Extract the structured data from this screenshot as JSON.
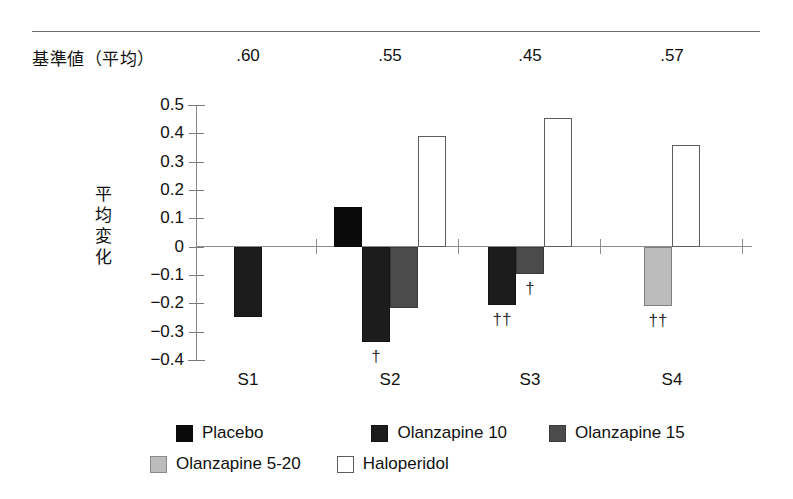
{
  "figure": {
    "baseline_row_label": "基準値（平均）",
    "y_axis_title_lines": [
      "平",
      "均",
      "変",
      "化"
    ]
  },
  "chart_data": {
    "type": "bar",
    "title": "",
    "xlabel": "",
    "ylabel": "平均変化",
    "ylim": [
      -0.4,
      0.5
    ],
    "ytick_labels": [
      "0.5",
      "0.4",
      "0.3",
      "0.2",
      "0.1",
      "0",
      "−0.1",
      "−0.2",
      "−0.3",
      "−0.4"
    ],
    "ytick_values": [
      0.5,
      0.4,
      0.3,
      0.2,
      0.1,
      0.0,
      -0.1,
      -0.2,
      -0.3,
      -0.4
    ],
    "grid": false,
    "legend_position": "bottom",
    "categories": [
      "S1",
      "S2",
      "S3",
      "S4"
    ],
    "baseline_means": [
      ".60",
      ".55",
      ".45",
      ".57"
    ],
    "series": [
      {
        "name": "Placebo",
        "color": "#0a0a0a",
        "values": [
          null,
          0.14,
          null,
          null
        ]
      },
      {
        "name": "Olanzapine 10",
        "color": "#1c1c1c",
        "values": [
          -0.25,
          -0.335,
          -0.205,
          null
        ]
      },
      {
        "name": "Olanzapine 15",
        "color": "#4b4b4b",
        "values": [
          null,
          -0.215,
          -0.095,
          null
        ]
      },
      {
        "name": "Olanzapine 5-20",
        "color": "#bcbcbc",
        "values": [
          null,
          null,
          null,
          -0.21
        ]
      },
      {
        "name": "Haloperidol",
        "color": "#ffffff",
        "values": [
          null,
          0.39,
          0.455,
          0.36
        ]
      }
    ],
    "annotations": [
      {
        "category": "S2",
        "series": "Olanzapine 10",
        "text": "†"
      },
      {
        "category": "S3",
        "series": "Olanzapine 10",
        "text": "††"
      },
      {
        "category": "S3",
        "series": "Olanzapine 15",
        "text": "†"
      },
      {
        "category": "S4",
        "series": "Olanzapine 5-20",
        "text": "††"
      }
    ]
  },
  "legend": {
    "row1": [
      {
        "label": "Placebo",
        "swatch": "placebo"
      },
      {
        "label": "Olanzapine 10",
        "swatch": "olz10"
      },
      {
        "label": "Olanzapine 15",
        "swatch": "olz15"
      }
    ],
    "row2": [
      {
        "label": "Olanzapine 5-20",
        "swatch": "olz520"
      },
      {
        "label": "Haloperidol",
        "swatch": "halo"
      }
    ]
  }
}
